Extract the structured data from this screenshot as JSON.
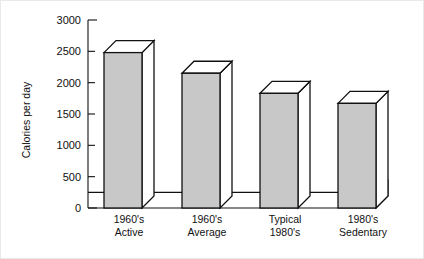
{
  "chart_data": {
    "type": "bar",
    "title": "",
    "subtitle": "",
    "xlabel": "",
    "ylabel": "Calories per day",
    "categories": [
      "1960's Active",
      "1960's Average",
      "Typical 1980's",
      "1980's Sedentary"
    ],
    "category_lines": [
      [
        "1960's",
        "Active"
      ],
      [
        "1960's",
        "Average"
      ],
      [
        "Typical",
        "1980's"
      ],
      [
        "1980's",
        "Sedentary"
      ]
    ],
    "values": [
      2480,
      2150,
      1830,
      1670
    ],
    "ylim": [
      0,
      3000
    ],
    "ytick_values": [
      0,
      500,
      1000,
      1500,
      2000,
      2500,
      3000
    ],
    "ytick_labels": [
      "0",
      "500",
      "1000",
      "1500",
      "2000",
      "2500",
      "3000"
    ],
    "grid": false,
    "legend": false,
    "legend_position": "none",
    "style": "3d-bars",
    "baseline_platform_value": 250,
    "bar_fill_color": "#c8c8c8",
    "bar_top_color": "#ffffff",
    "bar_side_color": "#ffffff",
    "outline_color": "#111111",
    "background_color": "#ffffff"
  }
}
